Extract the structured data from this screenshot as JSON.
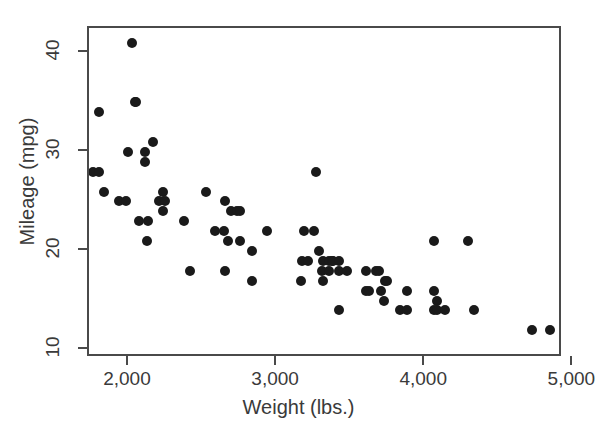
{
  "chart_data": {
    "type": "scatter",
    "title": "",
    "xlabel": "Weight (lbs.)",
    "ylabel": "Mileage (mpg)",
    "xlim": [
      1730,
      4930
    ],
    "ylim": [
      9.2,
      42.5
    ],
    "xticks": [
      2000,
      3000,
      4000,
      5000
    ],
    "xticklabels": [
      "2,000",
      "3,000",
      "4,000",
      "5,000"
    ],
    "yticks": [
      10,
      20,
      30,
      40
    ],
    "yticklabels": [
      "10",
      "20",
      "30",
      "40"
    ],
    "grid": false,
    "legend": null,
    "marker": {
      "shape": "circle",
      "color": "#1a1a1a",
      "size_px": 10
    },
    "frame_color": "#4a4a4a",
    "background": "#ffffff",
    "n_points": 74,
    "points": [
      {
        "x": 2020,
        "y": 41
      },
      {
        "x": 2040,
        "y": 35
      },
      {
        "x": 2050,
        "y": 35
      },
      {
        "x": 1800,
        "y": 34
      },
      {
        "x": 2160,
        "y": 31
      },
      {
        "x": 1990,
        "y": 30
      },
      {
        "x": 2110,
        "y": 30
      },
      {
        "x": 2110,
        "y": 29
      },
      {
        "x": 1760,
        "y": 28
      },
      {
        "x": 1800,
        "y": 28
      },
      {
        "x": 3260,
        "y": 28
      },
      {
        "x": 1830,
        "y": 26
      },
      {
        "x": 2230,
        "y": 26
      },
      {
        "x": 2520,
        "y": 26
      },
      {
        "x": 1930,
        "y": 25
      },
      {
        "x": 1980,
        "y": 25
      },
      {
        "x": 2200,
        "y": 25
      },
      {
        "x": 2240,
        "y": 25
      },
      {
        "x": 2650,
        "y": 25
      },
      {
        "x": 2230,
        "y": 24
      },
      {
        "x": 2690,
        "y": 24
      },
      {
        "x": 2730,
        "y": 24
      },
      {
        "x": 2750,
        "y": 24
      },
      {
        "x": 2070,
        "y": 23
      },
      {
        "x": 2130,
        "y": 23
      },
      {
        "x": 2370,
        "y": 23
      },
      {
        "x": 2580,
        "y": 22
      },
      {
        "x": 2640,
        "y": 22
      },
      {
        "x": 2930,
        "y": 22
      },
      {
        "x": 3180,
        "y": 22
      },
      {
        "x": 3250,
        "y": 22
      },
      {
        "x": 2120,
        "y": 21
      },
      {
        "x": 2670,
        "y": 21
      },
      {
        "x": 2750,
        "y": 21
      },
      {
        "x": 4060,
        "y": 21
      },
      {
        "x": 4290,
        "y": 21
      },
      {
        "x": 2830,
        "y": 20
      },
      {
        "x": 3280,
        "y": 20
      },
      {
        "x": 3170,
        "y": 19
      },
      {
        "x": 3210,
        "y": 19
      },
      {
        "x": 3310,
        "y": 19
      },
      {
        "x": 3350,
        "y": 19
      },
      {
        "x": 3370,
        "y": 19
      },
      {
        "x": 3380,
        "y": 19
      },
      {
        "x": 3420,
        "y": 19
      },
      {
        "x": 2410,
        "y": 18
      },
      {
        "x": 2650,
        "y": 18
      },
      {
        "x": 3300,
        "y": 18
      },
      {
        "x": 3350,
        "y": 18
      },
      {
        "x": 3420,
        "y": 18
      },
      {
        "x": 3470,
        "y": 18
      },
      {
        "x": 3600,
        "y": 18
      },
      {
        "x": 3670,
        "y": 18
      },
      {
        "x": 3690,
        "y": 18
      },
      {
        "x": 2830,
        "y": 17
      },
      {
        "x": 3160,
        "y": 17
      },
      {
        "x": 3310,
        "y": 17
      },
      {
        "x": 3730,
        "y": 17
      },
      {
        "x": 3740,
        "y": 17
      },
      {
        "x": 3600,
        "y": 16
      },
      {
        "x": 3620,
        "y": 16
      },
      {
        "x": 3700,
        "y": 16
      },
      {
        "x": 3880,
        "y": 16
      },
      {
        "x": 4060,
        "y": 16
      },
      {
        "x": 3720,
        "y": 15
      },
      {
        "x": 4080,
        "y": 15
      },
      {
        "x": 3420,
        "y": 14
      },
      {
        "x": 3830,
        "y": 14
      },
      {
        "x": 3880,
        "y": 14
      },
      {
        "x": 4060,
        "y": 14
      },
      {
        "x": 4080,
        "y": 14
      },
      {
        "x": 4130,
        "y": 14
      },
      {
        "x": 4330,
        "y": 14
      },
      {
        "x": 4720,
        "y": 12
      },
      {
        "x": 4840,
        "y": 12
      }
    ]
  }
}
